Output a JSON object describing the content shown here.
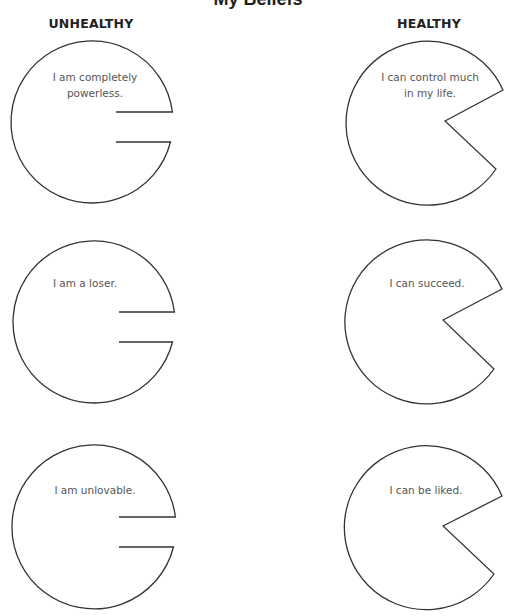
{
  "page": {
    "title": "My Beliefs",
    "columns": {
      "unhealthy": {
        "label": "UNHEALTHY",
        "center_x": 91
      },
      "healthy": {
        "label": "HEALTHY",
        "center_x": 429
      }
    },
    "stroke_color": "#333333",
    "text_color": "#555555"
  },
  "beliefs": [
    {
      "type": "unhealthy",
      "text": "I am completely\npowerless.",
      "circle": {
        "cx": 92,
        "cy": 122,
        "r": 81
      },
      "notch": {
        "inner_x": 116,
        "top_y": 112,
        "bottom_y": 142
      },
      "text_pos": {
        "x": 95,
        "y": 69
      }
    },
    {
      "type": "unhealthy",
      "text": "I am a loser.",
      "circle": {
        "cx": 94,
        "cy": 322,
        "r": 81
      },
      "notch": {
        "inner_x": 119,
        "top_y": 312,
        "bottom_y": 342
      },
      "text_pos": {
        "x": 85,
        "y": 275
      }
    },
    {
      "type": "unhealthy",
      "text": "I am unlovable.",
      "circle": {
        "cx": 94,
        "cy": 527,
        "r": 82
      },
      "notch": {
        "inner_x": 119,
        "top_y": 517,
        "bottom_y": 547
      },
      "text_pos": {
        "x": 95,
        "y": 482
      }
    },
    {
      "type": "healthy",
      "text": "I can control much\nin my life.",
      "circle": {
        "cx": 428,
        "cy": 122,
        "r": 82
      },
      "wedge": {
        "vertex_x": 445,
        "vertex_y": 121,
        "upper_x": 503,
        "upper_y": 90,
        "lower_x": 496,
        "lower_y": 169
      },
      "text_pos": {
        "x": 430,
        "y": 69
      }
    },
    {
      "type": "healthy",
      "text": "I can succeed.",
      "circle": {
        "cx": 427,
        "cy": 322,
        "r": 82
      },
      "wedge": {
        "vertex_x": 443,
        "vertex_y": 320,
        "upper_x": 502,
        "upper_y": 289,
        "lower_x": 494,
        "lower_y": 369
      },
      "text_pos": {
        "x": 427,
        "y": 275
      }
    },
    {
      "type": "healthy",
      "text": "I can be liked.",
      "circle": {
        "cx": 427,
        "cy": 528,
        "r": 82
      },
      "wedge": {
        "vertex_x": 443,
        "vertex_y": 526,
        "upper_x": 502,
        "upper_y": 496,
        "lower_x": 494,
        "lower_y": 574
      },
      "text_pos": {
        "x": 426,
        "y": 482
      }
    }
  ]
}
